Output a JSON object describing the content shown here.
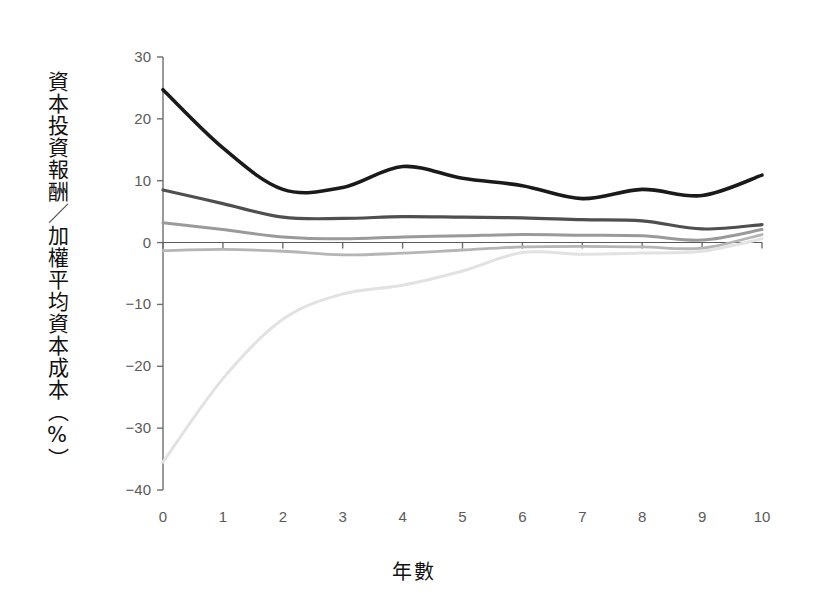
{
  "chart_data": {
    "type": "line",
    "title": "",
    "xlabel": "年數",
    "ylabel": "資本投資報酬／加權平均資本成本（%）",
    "xlim": [
      0,
      10
    ],
    "ylim": [
      -40,
      30
    ],
    "grid": false,
    "legend": "none",
    "x_ticks": [
      "0",
      "1",
      "2",
      "3",
      "4",
      "5",
      "6",
      "7",
      "8",
      "9",
      "10"
    ],
    "y_ticks": [
      "30",
      "20",
      "10",
      "0",
      "−10",
      "−20",
      "−30",
      "−40"
    ],
    "x": [
      0,
      1,
      2,
      3,
      4,
      5,
      6,
      7,
      8,
      9,
      10
    ],
    "series": [
      {
        "name": "quintile-1",
        "color": "#1a1a1a",
        "width": 3.6,
        "values": [
          24.7,
          15.3,
          8.6,
          8.9,
          12.3,
          10.4,
          9.2,
          7.1,
          8.6,
          7.6,
          10.9
        ]
      },
      {
        "name": "quintile-2",
        "color": "#4f4f4f",
        "width": 3.2,
        "values": [
          8.5,
          6.3,
          4.1,
          3.9,
          4.2,
          4.1,
          4.0,
          3.7,
          3.5,
          2.2,
          2.9
        ]
      },
      {
        "name": "quintile-3",
        "color": "#9a9a9a",
        "width": 3.0,
        "values": [
          3.2,
          2.1,
          0.9,
          0.6,
          0.9,
          1.1,
          1.3,
          1.2,
          1.1,
          0.4,
          2.1
        ]
      },
      {
        "name": "quintile-4",
        "color": "#b5b5b5",
        "width": 2.8,
        "values": [
          -1.3,
          -1.1,
          -1.4,
          -2.0,
          -1.7,
          -1.2,
          -0.7,
          -0.6,
          -0.7,
          -0.9,
          1.3
        ]
      },
      {
        "name": "quintile-5",
        "color": "#e2e2e2",
        "width": 3.0,
        "values": [
          -35.5,
          -22.0,
          -12.4,
          -8.3,
          -6.9,
          -4.6,
          -1.6,
          -1.9,
          -1.7,
          -1.4,
          0.6
        ]
      }
    ]
  },
  "axes": {
    "x_axis_name": "x-axis",
    "y_axis_name": "y-axis"
  }
}
